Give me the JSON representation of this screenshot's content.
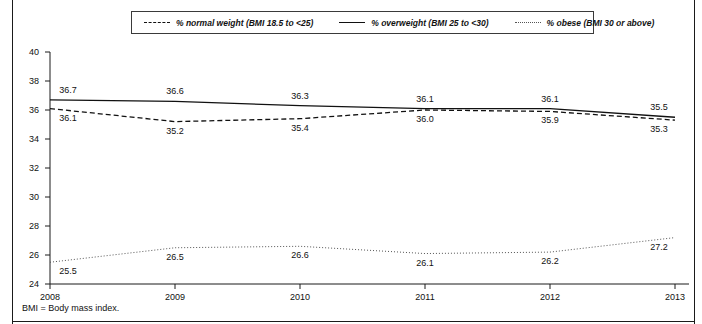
{
  "chart_data": {
    "type": "line",
    "title": "",
    "xlabel": "",
    "ylabel": "",
    "categories": [
      "2008",
      "2009",
      "2010",
      "2011",
      "2012",
      "2013"
    ],
    "x": [
      2008,
      2009,
      2010,
      2011,
      2012,
      2013
    ],
    "ylim": [
      24,
      40
    ],
    "yticks": [
      24,
      26,
      28,
      30,
      32,
      34,
      36,
      38,
      40
    ],
    "ytick_labels": [
      "24",
      "26",
      "28",
      "30",
      "32",
      "34",
      "36",
      "38",
      "40"
    ],
    "grid": false,
    "legend_position": "top-center",
    "series": [
      {
        "name": "% normal weight (BMI 18.5 to <25)",
        "style": "dashed",
        "color": "#111111",
        "values": [
          36.1,
          35.2,
          35.4,
          36.0,
          35.9,
          35.3
        ],
        "value_labels": [
          "36.1",
          "35.2",
          "35.4",
          "36.0",
          "35.9",
          "35.3"
        ]
      },
      {
        "name": "% overweight (BMI 25 to <30)",
        "style": "solid",
        "color": "#111111",
        "values": [
          36.7,
          36.6,
          36.3,
          36.1,
          36.1,
          35.5
        ],
        "value_labels": [
          "36.7",
          "36.6",
          "36.3",
          "36.1",
          "36.1",
          "35.5"
        ]
      },
      {
        "name": "% obese (BMI 30 or above)",
        "style": "dotted",
        "color": "#555555",
        "values": [
          25.5,
          26.5,
          26.6,
          26.1,
          26.2,
          27.2
        ],
        "value_labels": [
          "25.5",
          "26.5",
          "26.6",
          "26.1",
          "26.2",
          "27.2"
        ]
      }
    ]
  },
  "legend": {
    "items": [
      {
        "label": "% normal weight (BMI 18.5 to <25)",
        "style": "dashed"
      },
      {
        "label": "% overweight (BMI 25 to <30)",
        "style": "solid"
      },
      {
        "label": "% obese (BMI 30 or above)",
        "style": "dotted"
      }
    ]
  },
  "footnote": "BMI = Body mass index."
}
